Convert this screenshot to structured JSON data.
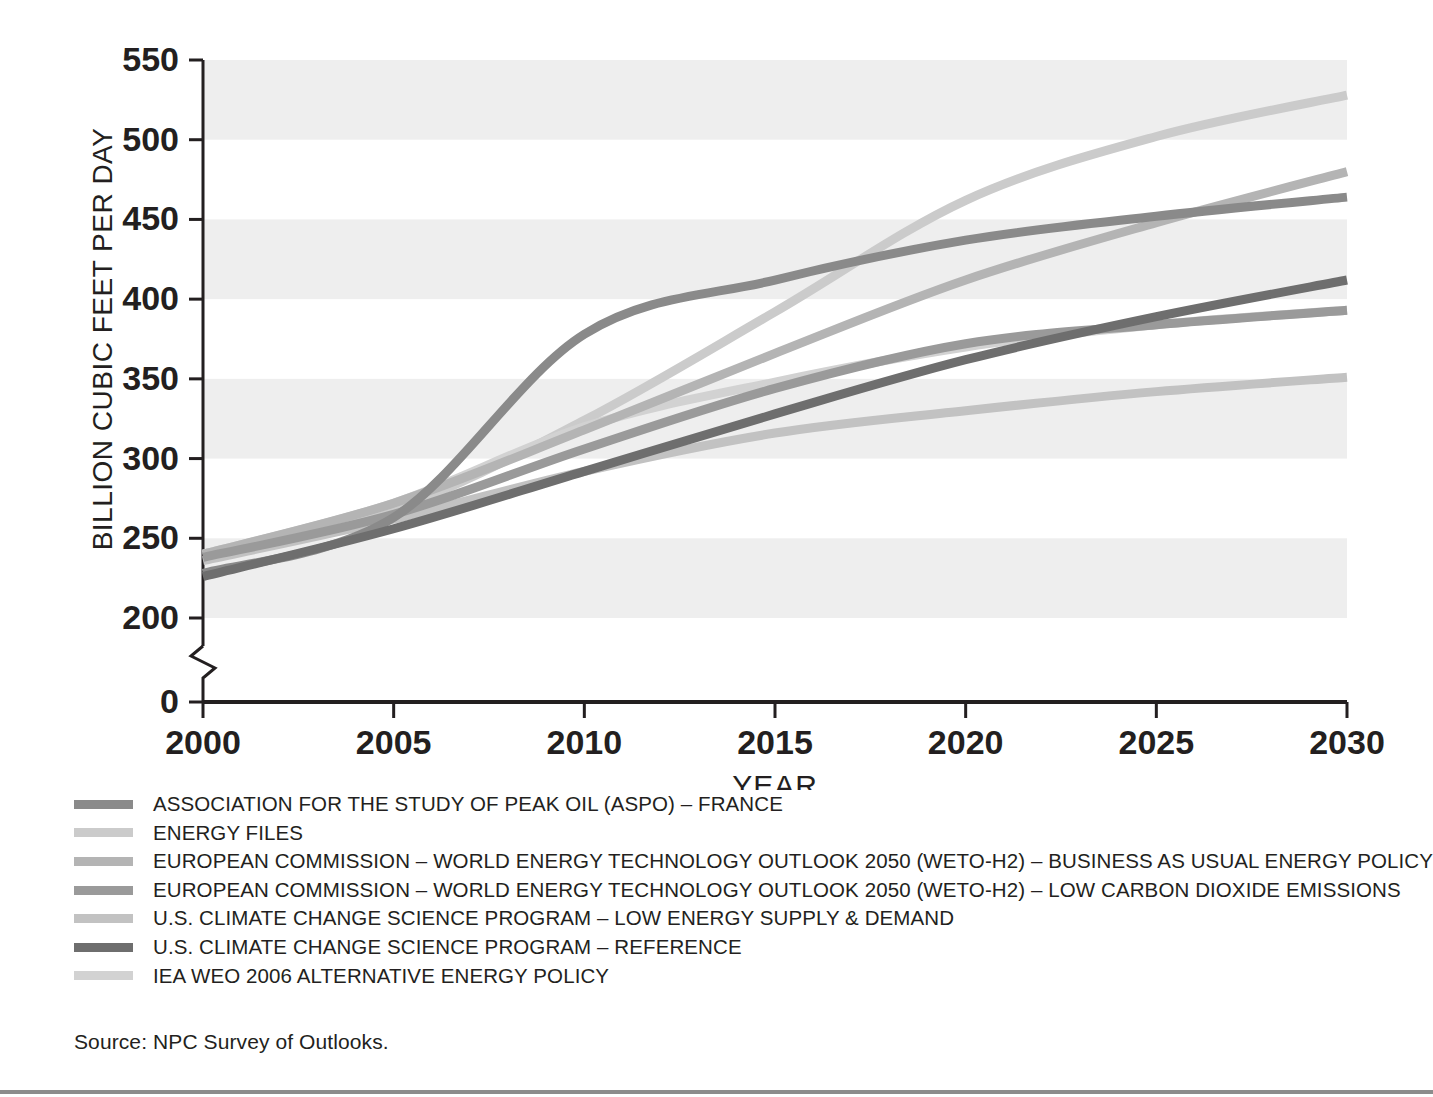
{
  "chart_data": {
    "type": "line",
    "title": "",
    "xlabel": "YEAR",
    "ylabel": "BILLION CUBIC FEET PER DAY",
    "xlim": [
      2000,
      2030
    ],
    "ylim": [
      200,
      550
    ],
    "y_axis_break": true,
    "y_zero_label": "0",
    "grid": "alternating-horizontal-bands",
    "legend_position": "below-plot",
    "xticks": [
      2000,
      2005,
      2010,
      2015,
      2020,
      2025,
      2030
    ],
    "yticks": [
      200,
      250,
      300,
      350,
      400,
      450,
      500,
      550
    ],
    "x": [
      2000,
      2005,
      2010,
      2015,
      2020,
      2025,
      2030
    ],
    "series": [
      {
        "name": "ASSOCIATION FOR THE STUDY OF PEAK OIL (ASPO) – FRANCE",
        "color": "#8a8a8a",
        "values": [
          228,
          263,
          378,
          412,
          437,
          452,
          464
        ]
      },
      {
        "name": "ENERGY FILES",
        "color": "#cbcbcb",
        "values": [
          240,
          268,
          324,
          392,
          462,
          502,
          528
        ]
      },
      {
        "name": "EUROPEAN COMMISSION – WORLD ENERGY TECHNOLOGY OUTLOOK 2050 (WETO-H2) – BUSINESS AS USUAL ENERGY POLICY",
        "color": "#b4b4b4",
        "values": [
          240,
          272,
          318,
          366,
          412,
          448,
          480
        ]
      },
      {
        "name": "EUROPEAN COMMISSION – WORLD ENERGY TECHNOLOGY OUTLOOK 2050 (WETO-H2) – LOW CARBON DIOXIDE EMISSIONS",
        "color": "#9a9a9a",
        "values": [
          238,
          265,
          306,
          344,
          372,
          384,
          393
        ]
      },
      {
        "name": "U.S. CLIMATE CHANGE SCIENCE PROGRAM – LOW ENERGY SUPPLY & DEMAND",
        "color": "#c2c2c2",
        "values": [
          236,
          262,
          292,
          316,
          330,
          342,
          351
        ]
      },
      {
        "name": "U.S. CLIMATE CHANGE SCIENCE PROGRAM – REFERENCE",
        "color": "#6e6e6e",
        "values": [
          226,
          256,
          292,
          328,
          362,
          389,
          412
        ]
      },
      {
        "name": "IEA WEO 2006 ALTERNATIVE ENERGY POLICY",
        "color": "#d2d2d2",
        "values": [
          240,
          272,
          320,
          348,
          370,
          384,
          393
        ]
      }
    ]
  },
  "axes": {
    "y_label": "BILLION CUBIC FEET PER DAY",
    "x_label": "YEAR",
    "y_ticks": [
      "550",
      "500",
      "450",
      "400",
      "350",
      "300",
      "250",
      "200"
    ],
    "y_zero": "0",
    "x_ticks": [
      "2000",
      "2005",
      "2010",
      "2015",
      "2020",
      "2025",
      "2030"
    ]
  },
  "legend": {
    "items": [
      {
        "label": "ASSOCIATION FOR THE STUDY OF PEAK OIL (ASPO) – FRANCE",
        "color": "#8a8a8a"
      },
      {
        "label": "ENERGY FILES",
        "color": "#cbcbcb"
      },
      {
        "label": "EUROPEAN COMMISSION – WORLD ENERGY TECHNOLOGY OUTLOOK 2050 (WETO-H2) – BUSINESS AS USUAL ENERGY POLICY",
        "color": "#b4b4b4"
      },
      {
        "label": "EUROPEAN COMMISSION – WORLD ENERGY TECHNOLOGY OUTLOOK 2050 (WETO-H2) – LOW CARBON DIOXIDE EMISSIONS",
        "color": "#9a9a9a"
      },
      {
        "label": "U.S. CLIMATE CHANGE SCIENCE PROGRAM – LOW ENERGY SUPPLY & DEMAND",
        "color": "#c2c2c2"
      },
      {
        "label": "U.S. CLIMATE CHANGE SCIENCE PROGRAM – REFERENCE",
        "color": "#6e6e6e"
      },
      {
        "label": "IEA WEO 2006 ALTERNATIVE ENERGY POLICY",
        "color": "#d2d2d2"
      }
    ]
  },
  "source_note": "Source: NPC Survey of Outlooks.",
  "colors": {
    "band": "#eeeeee",
    "axis": "#231f20",
    "text": "#231f20",
    "bottom_rule": "#8c8c8c"
  }
}
